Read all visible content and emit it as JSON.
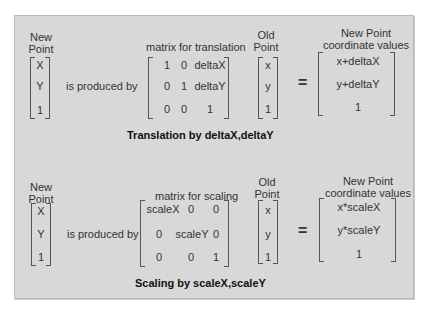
{
  "sections": [
    {
      "name": "translation",
      "new_point_label": [
        "New",
        "Point"
      ],
      "new_point_vector": [
        "X",
        "Y",
        "1"
      ],
      "produced_by": "is produced by",
      "matrix_label": "matrix for translation",
      "matrix": [
        [
          "1",
          "0",
          "deltaX"
        ],
        [
          "0",
          "1",
          "deltaY"
        ],
        [
          "0",
          "0",
          "1"
        ]
      ],
      "old_point_label": [
        "Old",
        "Point"
      ],
      "old_point_vector": [
        "x",
        "y",
        "1"
      ],
      "equals": "=",
      "result_label": [
        "New Point",
        "coordinate values"
      ],
      "result_vector": [
        "x+deltaX",
        "y+deltaY",
        "1"
      ],
      "caption": "Translation by deltaX,deltaY"
    },
    {
      "name": "scaling",
      "new_point_label": [
        "New",
        "Point"
      ],
      "new_point_vector": [
        "X",
        "Y",
        "1"
      ],
      "produced_by": "is produced by",
      "matrix_label": "matrix for scaling",
      "matrix": [
        [
          "scaleX",
          "0",
          "0"
        ],
        [
          "0",
          "scaleY",
          "0"
        ],
        [
          "0",
          "0",
          "1"
        ]
      ],
      "old_point_label": [
        "Old",
        "Point"
      ],
      "old_point_vector": [
        "x",
        "y",
        "1"
      ],
      "equals": "=",
      "result_label": [
        "New Point",
        "coordinate values"
      ],
      "result_vector": [
        "x*scaleX",
        "y*scaleY",
        "1"
      ],
      "caption": "Scaling by scaleX,scaleY"
    }
  ]
}
